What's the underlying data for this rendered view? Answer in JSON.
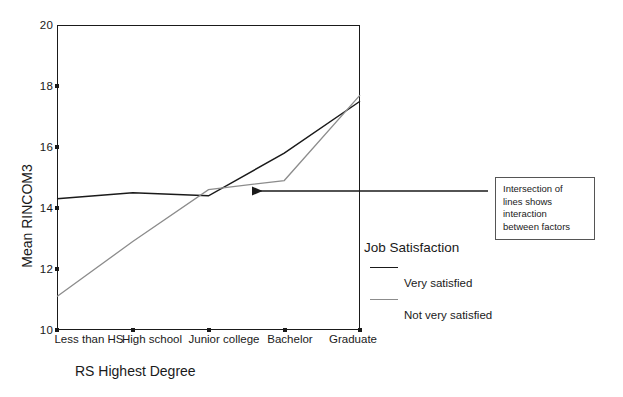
{
  "chart_data": {
    "type": "line",
    "title": "",
    "xlabel": "RS Highest Degree",
    "ylabel": "Mean RINCOM3",
    "categories": [
      "Less than HS",
      "High school",
      "Junior college",
      "Bachelor",
      "Graduate"
    ],
    "yticks": [
      "10",
      "12",
      "14",
      "16",
      "18",
      "20"
    ],
    "ylim": [
      10,
      20
    ],
    "grid": false,
    "legend_position": "right",
    "legend_title": "Job Satisfaction",
    "series": [
      {
        "name": "Very satisfied",
        "color": "#1a1a1a",
        "values": [
          14.3,
          14.5,
          14.4,
          15.8,
          17.5
        ]
      },
      {
        "name": "Not very satisfied",
        "color": "#8c8c8c",
        "values": [
          11.1,
          12.9,
          14.6,
          14.9,
          17.7
        ]
      }
    ],
    "annotations": [
      {
        "text": "Intersection of\nlines shows\ninteraction\nbetween factors",
        "arrow_from_x": 488,
        "arrow_from_y": 191,
        "arrow_to_x": 244,
        "arrow_to_y": 191
      }
    ]
  },
  "axis": {
    "ylabel": "Mean RINCOM3",
    "xlabel": "RS Highest Degree"
  },
  "legend": {
    "title": "Job Satisfaction",
    "entries": [
      {
        "label": "Very satisfied",
        "color": "#1a1a1a"
      },
      {
        "label": "Not very satisfied",
        "color": "#8c8c8c"
      }
    ]
  },
  "callout": {
    "text": "Intersection of\nlines shows\ninteraction\nbetween factors"
  }
}
